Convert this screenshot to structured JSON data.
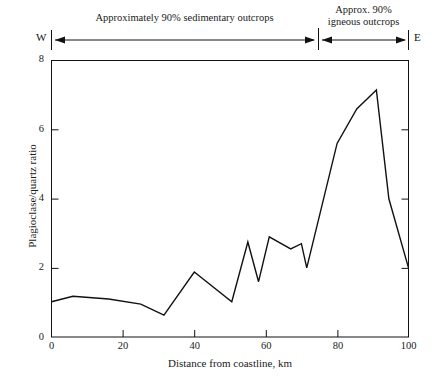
{
  "chart_data": {
    "type": "line",
    "title": "",
    "xlabel": "Distance from coastline, km",
    "ylabel": "Plagioclase/quartz ratio",
    "xlim": [
      0,
      100
    ],
    "ylim": [
      0,
      8
    ],
    "xticks": [
      0,
      20,
      40,
      60,
      80,
      100
    ],
    "yticks": [
      0,
      2,
      4,
      6,
      8
    ],
    "xtick_labels": [
      "0",
      "20",
      "40",
      "60",
      "80",
      "100"
    ],
    "ytick_labels": [
      "0",
      "2",
      "4",
      "6",
      "8"
    ],
    "grid": false,
    "legend": false,
    "series": [
      {
        "name": "Plagioclase/quartz ratio",
        "color": "#111111",
        "x": [
          0,
          6,
          16,
          25,
          31.5,
          40,
          50.5,
          55,
          58,
          61,
          67,
          70,
          71.5,
          80,
          85.5,
          91,
          94.5,
          100
        ],
        "y": [
          1.02,
          1.18,
          1.1,
          0.95,
          0.63,
          1.88,
          1.02,
          2.75,
          1.6,
          2.9,
          2.55,
          2.7,
          2.0,
          5.6,
          6.6,
          7.15,
          4.0,
          2.0
        ]
      }
    ],
    "annotations": [
      {
        "name": "sedimentary-span",
        "text": "Approximately 90% sedimentary outcrops",
        "x_start": 0,
        "x_end": 74.5,
        "style": "double-arrow"
      },
      {
        "name": "igneous-span",
        "text": "Approx.  90% igneous outcrops",
        "text_line1": "Approx.   90%",
        "text_line2": "igneous outcrops",
        "x_start": 74.5,
        "x_end": 100,
        "style": "double-arrow"
      },
      {
        "name": "west-marker",
        "text": "W"
      },
      {
        "name": "east-marker",
        "text": "E"
      }
    ]
  }
}
